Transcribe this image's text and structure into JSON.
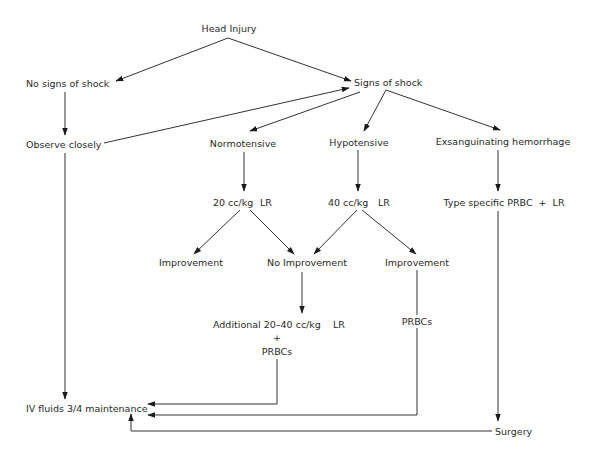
{
  "diagram": {
    "type": "flowchart",
    "nodes": {
      "head_injury": "Head Injury",
      "no_signs_of_shock": "No signs of shock",
      "signs_of_shock": "Signs of shock",
      "observe_closely": "Observe closely",
      "normotensive": "Normotensive",
      "hypotensive": "Hypotensive",
      "exsanguinating_hemorrhage": "Exsanguinating hemorrhage",
      "fluid_20": "20 cc/kg",
      "fluid_20_unit": "LR",
      "fluid_40": "40 cc/kg",
      "fluid_40_unit": "LR",
      "type_specific": "Type specific PRBC  +  LR",
      "improvement_left": "Improvement",
      "no_improvement": "No Improvement",
      "improvement_right": "Improvement",
      "additional": "Additional 20–40 cc/kg",
      "additional_unit": "LR",
      "plus": "+",
      "prbcs_center": "PRBCs",
      "prbcs_right": "PRBCs",
      "iv_fluids": "IV fluids 3/4 maintenance",
      "surgery": "Surgery"
    },
    "edges": [
      {
        "from": "Head Injury",
        "to": "No signs of shock"
      },
      {
        "from": "Head Injury",
        "to": "Signs of shock"
      },
      {
        "from": "No signs of shock",
        "to": "Observe closely"
      },
      {
        "from": "Observe closely",
        "to": "Signs of shock"
      },
      {
        "from": "Observe closely",
        "to": "IV fluids 3/4 maintenance"
      },
      {
        "from": "Signs of shock",
        "to": "Normotensive"
      },
      {
        "from": "Signs of shock",
        "to": "Hypotensive"
      },
      {
        "from": "Signs of shock",
        "to": "Exsanguinating hemorrhage"
      },
      {
        "from": "Normotensive",
        "to": "20 cc/kg LR"
      },
      {
        "from": "Hypotensive",
        "to": "40 cc/kg LR"
      },
      {
        "from": "Exsanguinating hemorrhage",
        "to": "Type specific PRBC + LR"
      },
      {
        "from": "20 cc/kg LR",
        "to": "Improvement"
      },
      {
        "from": "20 cc/kg LR",
        "to": "No Improvement"
      },
      {
        "from": "40 cc/kg LR",
        "to": "No Improvement"
      },
      {
        "from": "40 cc/kg LR",
        "to": "Improvement"
      },
      {
        "from": "No Improvement",
        "to": "Additional 20-40 cc/kg LR + PRBCs"
      },
      {
        "from": "Additional 20-40 cc/kg LR + PRBCs",
        "to": "IV fluids 3/4 maintenance"
      },
      {
        "from": "Improvement",
        "to": "IV fluids 3/4 maintenance",
        "label": "PRBCs"
      },
      {
        "from": "Type specific PRBC + LR",
        "to": "Surgery"
      },
      {
        "from": "Surgery",
        "to": "IV fluids 3/4 maintenance"
      }
    ]
  }
}
